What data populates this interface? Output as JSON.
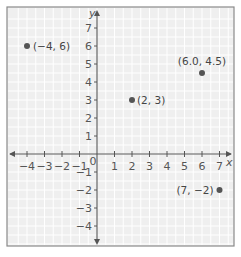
{
  "chart_data": {
    "type": "scatter",
    "title": "",
    "xlabel": "x",
    "ylabel": "y",
    "xlim": [
      -4.5,
      7.5
    ],
    "ylim": [
      -5,
      7.5
    ],
    "grid": true,
    "x_ticks": [
      -4,
      -3,
      -2,
      -1,
      0,
      1,
      2,
      3,
      4,
      5,
      6,
      7
    ],
    "y_ticks": [
      -4,
      -3,
      -2,
      -1,
      1,
      2,
      3,
      4,
      5,
      6,
      7
    ],
    "x_tick_labels": [
      "−4",
      "−3",
      "−2",
      "−1",
      "0",
      "1",
      "2",
      "3",
      "4",
      "5",
      "6",
      "7"
    ],
    "y_tick_labels": [
      "−4",
      "−3",
      "−2",
      "−1",
      "1",
      "2",
      "3",
      "4",
      "5",
      "6",
      "7"
    ],
    "points": [
      {
        "x": -4,
        "y": 6,
        "label": "(−4, 6)"
      },
      {
        "x": 2,
        "y": 3,
        "label": "(2, 3)"
      },
      {
        "x": 6.0,
        "y": 4.5,
        "label": "(6.0, 4.5)"
      },
      {
        "x": 7,
        "y": -2,
        "label": "(7, −2)"
      }
    ]
  },
  "colors": {
    "background": "#efefef",
    "grid": "#ffffff",
    "axis": "#555555",
    "point": "#555555"
  }
}
